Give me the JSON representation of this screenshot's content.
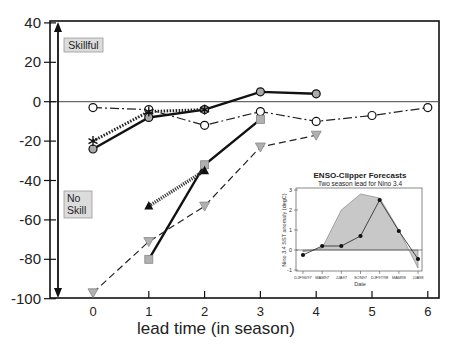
{
  "chart_data": {
    "type": "line",
    "title": "",
    "xlabel": "lead time (in season)",
    "ylabel": "",
    "xlim": [
      -0.75,
      6.2
    ],
    "ylim": [
      -100,
      40
    ],
    "x_ticks": [
      0,
      1,
      2,
      3,
      4,
      5,
      6
    ],
    "y_ticks": [
      40,
      20,
      0,
      -20,
      -40,
      -60,
      -80,
      -100
    ],
    "grid": false,
    "reference_line": 0,
    "annotations": [
      {
        "text": "Skillful",
        "position": "upper-left",
        "arrow": "up"
      },
      {
        "text": "No Skill",
        "position": "lower-left",
        "arrow": "down"
      }
    ],
    "series": [
      {
        "name": "open-circle dash-dot",
        "marker": "open-circle",
        "line": "dash-dot",
        "x": [
          0,
          1,
          2,
          3,
          4,
          5,
          6
        ],
        "values": [
          -3,
          -4,
          -12,
          -5,
          -10,
          -7,
          -3
        ]
      },
      {
        "name": "grey-circle solid",
        "marker": "grey-circle",
        "line": "solid",
        "x": [
          0,
          1,
          2,
          3,
          4
        ],
        "values": [
          -24,
          -8,
          -4,
          5,
          4
        ]
      },
      {
        "name": "star dotted",
        "marker": "asterisk",
        "line": "dotted",
        "x": [
          0,
          1,
          2
        ],
        "values": [
          -20,
          -5,
          -4
        ]
      },
      {
        "name": "grey-square solid",
        "marker": "grey-square",
        "line": "solid",
        "x": [
          1,
          2,
          3
        ],
        "values": [
          -80,
          -32,
          -9
        ]
      },
      {
        "name": "black-triangle dotted",
        "marker": "black-triangle",
        "line": "dotted-thick",
        "x": [
          1,
          2
        ],
        "values": [
          -53,
          -35
        ]
      },
      {
        "name": "grey-down-triangle dashed",
        "marker": "grey-down-triangle",
        "line": "dashed",
        "x": [
          0,
          1,
          2,
          3,
          4
        ],
        "values": [
          -97,
          -71,
          -53,
          -23,
          -17
        ]
      }
    ],
    "inset": {
      "type": "area+line",
      "title": "ENSO-Clipper Forecasts",
      "subtitle": "Two season lead for Nino 3.4",
      "xlabel": "Date",
      "ylabel": "Nino 3.4 SST anomaly (degC)",
      "ylim": [
        -1,
        3
      ],
      "y_ticks": [
        3,
        2,
        1,
        0,
        -1
      ],
      "categories": [
        "DJF96/97",
        "MAM97",
        "JJA97",
        "SON97",
        "DJF97/98",
        "MAM98",
        "JJA98"
      ],
      "series": [
        {
          "name": "observed (shaded)",
          "values": [
            -0.1,
            0.1,
            2.0,
            2.8,
            2.6,
            1.0,
            -0.9
          ]
        },
        {
          "name": "forecast (dots)",
          "values": [
            -0.25,
            0.2,
            0.2,
            0.7,
            2.5,
            0.95,
            -0.45
          ]
        }
      ]
    }
  },
  "labels": {
    "skillful": "Skillful",
    "no": "No",
    "skill": "Skill",
    "xlabel": "lead time (in season)",
    "inset_title": "ENSO-Clipper Forecasts",
    "inset_subtitle": "Two season lead for Nino 3.4",
    "inset_xlabel": "Date",
    "inset_ylabel": "Nino 3.4 SST anomaly (degC)"
  },
  "colors": {
    "axis": "#111111",
    "grey_fill": "#b8b8b8",
    "label_box": "#d9d9d9",
    "inset_area": "#c8c8c8"
  }
}
